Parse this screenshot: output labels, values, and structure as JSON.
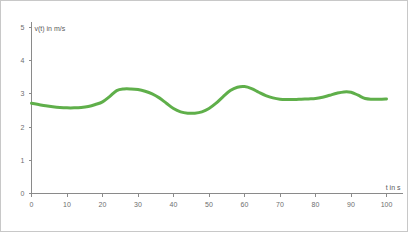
{
  "chart_data": {
    "type": "line",
    "title": "",
    "subtitle": "",
    "xlabel": "t in s",
    "ylabel": "v(t) in m/s",
    "xlim": [
      0,
      100
    ],
    "ylim": [
      0,
      5
    ],
    "xticks": [
      0,
      10,
      20,
      30,
      40,
      50,
      60,
      70,
      80,
      90,
      100
    ],
    "yticks": [
      0,
      1,
      2,
      3,
      4,
      5
    ],
    "xtick_labels": [
      "0",
      "10",
      "20",
      "30",
      "40",
      "50",
      "60",
      "70",
      "80",
      "90",
      "100"
    ],
    "ytick_labels": [
      "0",
      "1",
      "2",
      "3",
      "4",
      "5"
    ],
    "grid": false,
    "legend": null,
    "legend_position": "none",
    "series": [
      {
        "name": "v(t)",
        "color": "#5faf4a",
        "line_width": 3,
        "x": [
          0,
          2,
          4,
          6,
          8,
          10,
          12,
          14,
          16,
          18,
          20,
          22,
          24,
          26,
          28,
          30,
          32,
          34,
          36,
          38,
          40,
          42,
          44,
          46,
          48,
          50,
          52,
          54,
          56,
          58,
          60,
          62,
          64,
          66,
          68,
          70,
          72,
          74,
          76,
          78,
          80,
          82,
          84,
          86,
          88,
          90,
          92,
          94,
          96,
          98,
          100
        ],
        "values": [
          2.72,
          2.68,
          2.64,
          2.61,
          2.59,
          2.58,
          2.58,
          2.59,
          2.62,
          2.68,
          2.76,
          2.92,
          3.1,
          3.15,
          3.15,
          3.13,
          3.08,
          3.0,
          2.88,
          2.72,
          2.56,
          2.46,
          2.42,
          2.42,
          2.46,
          2.56,
          2.72,
          2.92,
          3.1,
          3.2,
          3.22,
          3.16,
          3.05,
          2.95,
          2.88,
          2.84,
          2.83,
          2.83,
          2.84,
          2.85,
          2.86,
          2.9,
          2.96,
          3.02,
          3.06,
          3.05,
          2.96,
          2.86,
          2.84,
          2.84,
          2.85
        ]
      }
    ],
    "axis_color": "#8a8a8a",
    "tick_label_color": "#6e6e6e",
    "background": "#ffffff",
    "border_color": "#c8c8c8"
  }
}
